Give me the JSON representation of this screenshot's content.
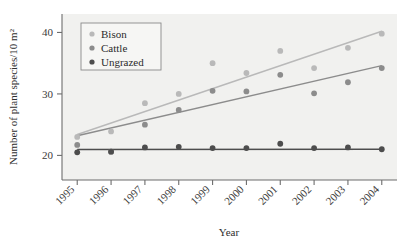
{
  "chart_data": {
    "type": "scatter",
    "title": "",
    "xlabel": "Year",
    "ylabel": "Number of plant species/10 m²",
    "x": [
      1995,
      1996,
      1997,
      1998,
      1999,
      2000,
      2001,
      2002,
      2003,
      2004
    ],
    "categories": [
      "1995",
      "1996",
      "1997",
      "1998",
      "1999",
      "2000",
      "2001",
      "2002",
      "2003",
      "2004"
    ],
    "xtick_labels": [
      "1995",
      "1996",
      "1997",
      "1998",
      "1999",
      "2000",
      "2001",
      "2002",
      "2003",
      "2004"
    ],
    "ytick_labels": [
      "20",
      "30",
      "40"
    ],
    "yticks": [
      20,
      30,
      40
    ],
    "ylim": [
      16.0,
      43.0
    ],
    "xlim": [
      1994.55,
      2004.45
    ],
    "grid": false,
    "legend_position": "top-left-inside",
    "series": [
      {
        "name": "Bison",
        "color": "#b9b9b9",
        "values": [
          23.0,
          23.9,
          28.5,
          30.0,
          35.0,
          33.4,
          37.0,
          34.2,
          37.5,
          39.8
        ],
        "trendline": {
          "x0": 1995,
          "y0": 23.4,
          "x1": 2004,
          "y1": 40.2
        }
      },
      {
        "name": "Cattle",
        "color": "#8c8c8c",
        "values": [
          21.7,
          20.6,
          25.0,
          27.4,
          30.5,
          30.4,
          33.1,
          30.1,
          31.9,
          34.2
        ],
        "trendline": {
          "x0": 1995,
          "y0": 23.2,
          "x1": 2004,
          "y1": 34.6
        }
      },
      {
        "name": "Ungrazed",
        "color": "#4d4d4d",
        "values": [
          20.5,
          20.6,
          21.3,
          21.4,
          21.2,
          21.2,
          21.9,
          21.2,
          21.3,
          21.0
        ],
        "trendline": {
          "x0": 1995,
          "y0": 20.95,
          "x1": 2004,
          "y1": 21.0
        }
      }
    ]
  },
  "legend": {
    "items": [
      {
        "label": "Bison"
      },
      {
        "label": "Cattle"
      },
      {
        "label": "Ungrazed"
      }
    ]
  },
  "axes": {
    "x_title": "Year",
    "y_title": "Number of plant species/10 m²"
  },
  "style": {
    "plot_background": "#f1f1ef",
    "page_background": "#ffffff",
    "axis_color": "#6d6d6d",
    "legend_border": "#8a8a8a"
  }
}
